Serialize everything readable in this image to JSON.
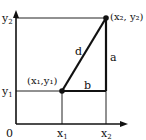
{
  "diagram": {
    "type": "coordinate-distance-diagram",
    "origin_label": "0",
    "x_axis_ticks": [
      {
        "base": "x",
        "sub": "1"
      },
      {
        "base": "x",
        "sub": "2"
      }
    ],
    "y_axis_ticks": [
      {
        "base": "y",
        "sub": "1"
      },
      {
        "base": "y",
        "sub": "2"
      }
    ],
    "points": [
      {
        "label": "(x₁,y₁)",
        "x": 62,
        "y": 91
      },
      {
        "label": "(x₂, y₂)",
        "x": 106,
        "y": 18
      }
    ],
    "segments": {
      "hypotenuse": "d",
      "vertical_leg": "a",
      "horizontal_leg": "b"
    },
    "colors": {
      "line": "#111111",
      "guide": "#222222",
      "background": "#ffffff"
    }
  }
}
